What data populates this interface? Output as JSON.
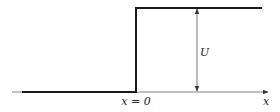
{
  "diagram": {
    "type": "step-function",
    "labels": {
      "step_location": "x = 0",
      "axis": "x",
      "height": "U"
    },
    "colors": {
      "line": "#1a1a1a",
      "axis": "#555555",
      "background": "#ffffff"
    }
  }
}
